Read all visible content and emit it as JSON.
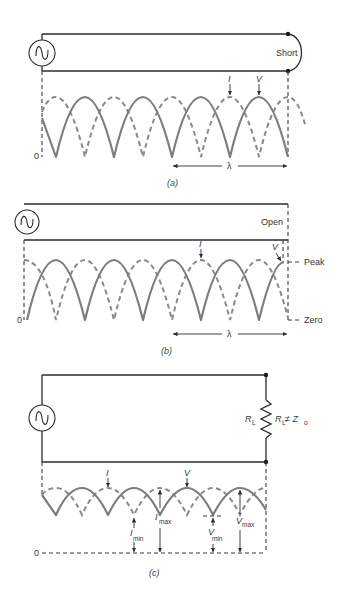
{
  "colors": {
    "wire": "#2b2b2b",
    "solid_wave": "#7d7d7d",
    "dashed_wave": "#8a8a8a",
    "background": "#ffffff"
  },
  "panel_a": {
    "caption": "(a)",
    "termination_label": "Short",
    "zero_label": "0",
    "current_label": "I",
    "voltage_label": "V",
    "wavelength_label": "λ",
    "source_icon": "ac-source-icon"
  },
  "panel_b": {
    "caption": "(b)",
    "termination_label": "Open",
    "zero_label": "0",
    "current_label": "I",
    "voltage_label": "V",
    "wavelength_label": "λ",
    "peak_label": "Peak",
    "zero_level_label": "Zero",
    "source_icon": "ac-source-icon"
  },
  "panel_c": {
    "caption": "(c)",
    "zero_label": "0",
    "current_label": "I",
    "voltage_label": "V",
    "load_label": "R",
    "load_sub": "L",
    "condition_R": "R",
    "condition_R_sub": "L",
    "condition_rel": " ≠ Z",
    "condition_Z_sub": "o",
    "imin_label": "I",
    "imin_sub": "min",
    "imax_label": "I",
    "imax_sub": "max",
    "vmin_label": "V",
    "vmin_sub": "min",
    "vmax_label": "V",
    "vmax_sub": "max",
    "source_icon": "ac-source-icon"
  }
}
